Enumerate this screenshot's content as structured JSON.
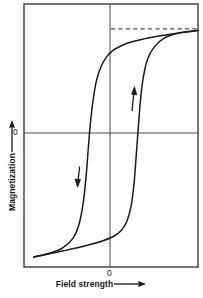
{
  "chart_data": {
    "type": "line",
    "title": "",
    "subtitle": "",
    "xlabel": "Field strength",
    "ylabel": "Magnetization",
    "xlabel_arrow": "⟶",
    "ylabel_arrow": "⟶",
    "xlim": [
      -2.5,
      2.5
    ],
    "ylim": [
      -2.1,
      2.35
    ],
    "x_ticks": [
      "0"
    ],
    "x_tick_values": [
      0
    ],
    "y_ticks": [
      "0"
    ],
    "y_tick_values": [
      0
    ],
    "grid": false,
    "legend": null,
    "axis_lines": {
      "x_zero_line": 0,
      "y_zero_line": 0
    },
    "annotations": [
      {
        "name": "saturation-dashed-line",
        "kind": "dashed-horizontal",
        "y": 1.93,
        "x_start": 0,
        "x_end": 2.5,
        "color": "#4c4c4c"
      },
      {
        "name": "descending-branch-arrow",
        "kind": "arrow",
        "direction": "down",
        "x": -0.92,
        "y": -0.62
      },
      {
        "name": "ascending-branch-arrow",
        "kind": "arrow",
        "direction": "up",
        "x": 0.66,
        "y": 0.72
      }
    ],
    "series": [
      {
        "name": "descending-branch",
        "description": "Upper branch of hysteresis loop, field decreasing from positive to negative saturation",
        "color": "#1a1a1a",
        "points": [
          [
            2.5,
            1.9
          ],
          [
            2.1,
            1.87
          ],
          [
            1.7,
            1.84
          ],
          [
            1.3,
            1.8
          ],
          [
            0.95,
            1.76
          ],
          [
            0.6,
            1.71
          ],
          [
            0.28,
            1.64
          ],
          [
            0.05,
            1.56
          ],
          [
            -0.12,
            1.46
          ],
          [
            -0.28,
            1.3
          ],
          [
            -0.42,
            1.05
          ],
          [
            -0.52,
            0.7
          ],
          [
            -0.6,
            0.28
          ],
          [
            -0.66,
            -0.15
          ],
          [
            -0.72,
            -0.6
          ],
          [
            -0.8,
            -1.02
          ],
          [
            -0.92,
            -1.38
          ],
          [
            -1.1,
            -1.62
          ],
          [
            -1.4,
            -1.78
          ],
          [
            -1.8,
            -1.87
          ],
          [
            -2.22,
            -1.93
          ]
        ]
      },
      {
        "name": "ascending-branch",
        "description": "Lower branch of hysteresis loop, field increasing from negative to positive saturation",
        "color": "#1a1a1a",
        "points": [
          [
            -2.22,
            -1.93
          ],
          [
            -1.8,
            -1.88
          ],
          [
            -1.4,
            -1.83
          ],
          [
            -1.0,
            -1.78
          ],
          [
            -0.6,
            -1.72
          ],
          [
            -0.25,
            -1.66
          ],
          [
            0.08,
            -1.58
          ],
          [
            0.3,
            -1.48
          ],
          [
            0.46,
            -1.32
          ],
          [
            0.58,
            -1.06
          ],
          [
            0.66,
            -0.7
          ],
          [
            0.72,
            -0.25
          ],
          [
            0.78,
            0.22
          ],
          [
            0.84,
            0.68
          ],
          [
            0.92,
            1.08
          ],
          [
            1.04,
            1.4
          ],
          [
            1.24,
            1.62
          ],
          [
            1.55,
            1.78
          ],
          [
            1.95,
            1.86
          ],
          [
            2.45,
            1.9
          ]
        ]
      }
    ],
    "frame": {
      "border": true,
      "border_color": "#3a3a3a",
      "background": "#ffffff"
    }
  },
  "labels": {
    "x_axis_title": "Field strength",
    "y_axis_title": "Magnetization",
    "x_zero": "0",
    "y_zero": "0"
  },
  "colors": {
    "curve": "#1a1a1a",
    "frame": "#3a3a3a",
    "axis": "#4a4a4a",
    "dashed": "#555555",
    "text": "#171717",
    "background": "#ffffff"
  }
}
